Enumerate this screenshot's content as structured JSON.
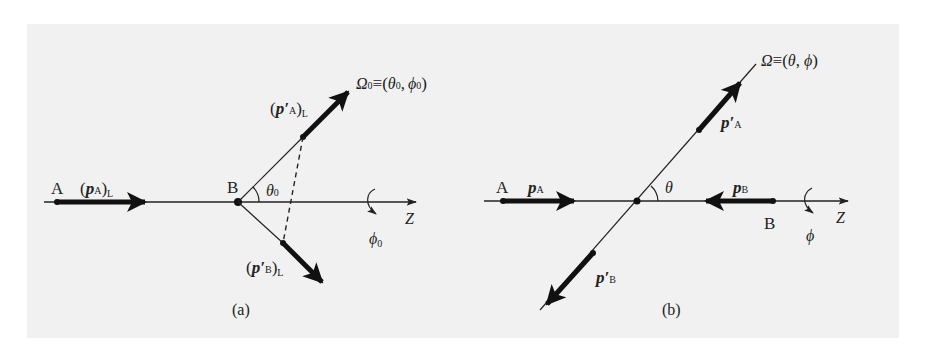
{
  "figure": {
    "background_color": "#f1f1f1",
    "ink_color": "#111111"
  },
  "panel_a": {
    "caption": "(a)",
    "particle_a_label": "A",
    "particle_b_label": "B",
    "p_a_label": {
      "open": "(",
      "vec": "p",
      "sub": "A",
      "close": ")",
      "frame": "L"
    },
    "p_a_prime_label": {
      "open": "(",
      "vec": "p′",
      "sub": "A",
      "close": ")",
      "frame": "L"
    },
    "p_b_prime_label": {
      "open": "(",
      "vec": "p′",
      "sub": "B",
      "close": ")",
      "frame": "L"
    },
    "angle_label": "θ",
    "angle_sub": "0",
    "axis_label": "Z",
    "rotation_label": "ϕ",
    "rotation_sub": "0",
    "direction_label": {
      "omega": "Ω",
      "omega_sub": "0",
      "equiv": "≡",
      "open": "(",
      "theta": "θ",
      "theta_sub": "0",
      "comma": ",",
      "phi": "ϕ",
      "phi_sub": "0",
      "close": ")"
    }
  },
  "panel_b": {
    "caption": "(b)",
    "particle_a_label": "A",
    "particle_b_label": "B",
    "p_a_label": {
      "vec": "p",
      "sub": "A"
    },
    "p_b_label": {
      "vec": "p",
      "sub": "B"
    },
    "p_a_prime_label": {
      "vec": "p′",
      "sub": "A"
    },
    "p_b_prime_label": {
      "vec": "p′",
      "sub": "B"
    },
    "angle_label": "θ",
    "axis_label": "Z",
    "rotation_label": "ϕ",
    "direction_label": {
      "omega": "Ω",
      "equiv": "≡",
      "open": "(",
      "theta": "θ",
      "comma": ",",
      "phi": "ϕ",
      "close": ")"
    }
  }
}
